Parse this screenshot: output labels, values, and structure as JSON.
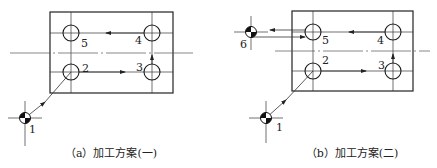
{
  "diagrams": [
    {
      "id": "a",
      "caption": "（a）加工方案(一)",
      "labels": {
        "p1": "1",
        "p2": "2",
        "p3": "3",
        "p4": "4",
        "p5": "5"
      }
    },
    {
      "id": "b",
      "caption": "（b）加工方案(二)",
      "labels": {
        "p1": "1",
        "p2": "2",
        "p3": "3",
        "p4": "4",
        "p5": "5",
        "p6": "6"
      }
    }
  ],
  "colors": {
    "line": "#333333",
    "background": "#ffffff"
  }
}
